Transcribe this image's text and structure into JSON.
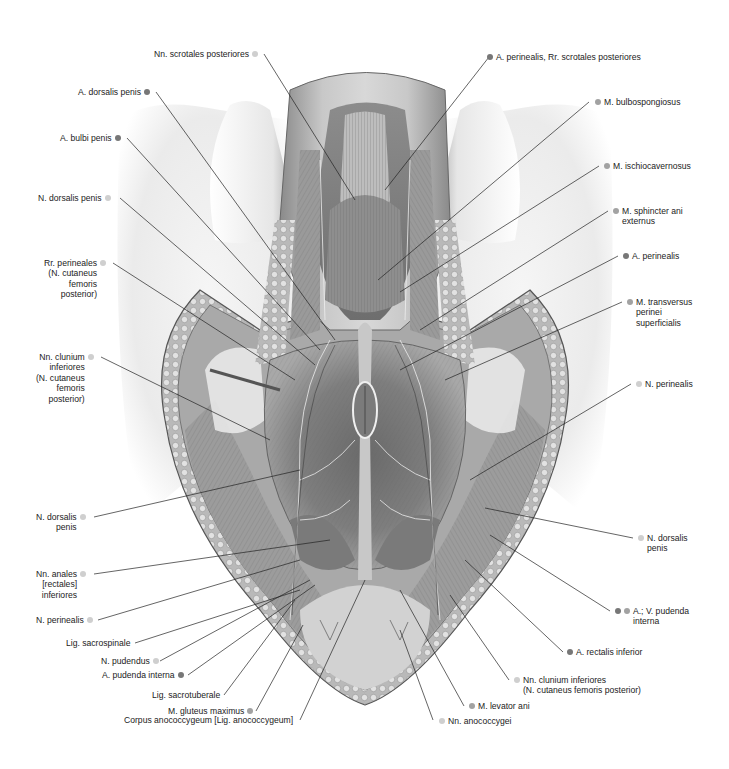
{
  "figure": {
    "legend_dot_colors": {
      "artery": "#777777",
      "muscle": "#a2a2a2",
      "nerve": "#cfcfcf"
    }
  },
  "labels_left": [
    {
      "id": "nn-scrotales-posteriores",
      "lines": [
        "Nn. scrotales posteriores"
      ],
      "dots": [
        "nerve"
      ]
    },
    {
      "id": "a-dorsalis-penis",
      "lines": [
        "A. dorsalis penis"
      ],
      "dots": [
        "artery"
      ]
    },
    {
      "id": "a-bulbi-penis",
      "lines": [
        "A. bulbi penis"
      ],
      "dots": [
        "artery"
      ]
    },
    {
      "id": "n-dorsalis-penis-upper",
      "lines": [
        "N. dorsalis penis"
      ],
      "dots": [
        "nerve"
      ]
    },
    {
      "id": "rr-perineales",
      "lines": [
        "Rr. perineales",
        "(N. cutaneus",
        "femoris",
        "posterior)"
      ],
      "dots": [
        "nerve"
      ]
    },
    {
      "id": "nn-clunium-inferiores-left",
      "lines": [
        "Nn. clunium",
        "inferiores",
        "(N. cutaneus",
        "femoris",
        "posterior)"
      ],
      "dots": [
        "nerve"
      ]
    },
    {
      "id": "n-dorsalis-penis-lower",
      "lines": [
        "N. dorsalis",
        "penis"
      ],
      "dots": [
        "nerve"
      ]
    },
    {
      "id": "nn-anales",
      "lines": [
        "Nn. anales",
        "[rectales]",
        "inferiores"
      ],
      "dots": [
        "nerve"
      ]
    },
    {
      "id": "n-perinealis-left",
      "lines": [
        "N. perinealis"
      ],
      "dots": [
        "nerve"
      ]
    },
    {
      "id": "lig-sacrospinale",
      "lines": [
        "Lig. sacrospinale"
      ],
      "dots": []
    },
    {
      "id": "n-pudendus",
      "lines": [
        "N. pudendus"
      ],
      "dots": [
        "nerve"
      ]
    },
    {
      "id": "a-pudenda-interna",
      "lines": [
        "A. pudenda interna"
      ],
      "dots": [
        "artery"
      ]
    },
    {
      "id": "lig-sacrotuberale",
      "lines": [
        "Lig. sacrotuberale"
      ],
      "dots": []
    },
    {
      "id": "m-gluteus-maximus",
      "lines": [
        "M. gluteus maximus"
      ],
      "dots": [
        "muscle"
      ]
    },
    {
      "id": "corpus-anococcygeum",
      "lines": [
        "Corpus anococcygeum [Lig. anococcygeum]"
      ],
      "dots": []
    }
  ],
  "labels_right": [
    {
      "id": "a-perinealis-rr-scrotales",
      "lines": [
        "A. perinealis, Rr. scrotales posteriores"
      ],
      "dots": [
        "artery"
      ]
    },
    {
      "id": "m-bulbospongiosus",
      "lines": [
        "M. bulbospongiosus"
      ],
      "dots": [
        "muscle"
      ]
    },
    {
      "id": "m-ischiocavernosus",
      "lines": [
        "M. ischiocavernosus"
      ],
      "dots": [
        "muscle"
      ]
    },
    {
      "id": "m-sphincter-ani-externus",
      "lines": [
        "M. sphincter ani",
        "externus"
      ],
      "dots": [
        "muscle"
      ]
    },
    {
      "id": "a-perinealis",
      "lines": [
        "A. perinealis"
      ],
      "dots": [
        "artery"
      ]
    },
    {
      "id": "m-transversus-perinei",
      "lines": [
        "M. transversus",
        "perinei",
        "superficialis"
      ],
      "dots": [
        "muscle"
      ]
    },
    {
      "id": "n-perinealis-right",
      "lines": [
        "N. perinealis"
      ],
      "dots": [
        "nerve"
      ]
    },
    {
      "id": "n-dorsalis-penis-right",
      "lines": [
        "N. dorsalis",
        "penis"
      ],
      "dots": [
        "nerve"
      ]
    },
    {
      "id": "a-v-pudenda-interna",
      "lines": [
        "A.; V. pudenda",
        "interna"
      ],
      "dots": [
        "artery",
        "muscle"
      ]
    },
    {
      "id": "a-rectalis-inferior",
      "lines": [
        "A. rectalis inferior"
      ],
      "dots": [
        "artery"
      ]
    },
    {
      "id": "nn-clunium-inferiores-right",
      "lines": [
        "Nn. clunium inferiores",
        "(N. cutaneus femoris posterior)"
      ],
      "dots": [
        "nerve"
      ]
    },
    {
      "id": "m-levator-ani",
      "lines": [
        "M. levator ani"
      ],
      "dots": [
        "muscle"
      ]
    },
    {
      "id": "nn-anococcygei",
      "lines": [
        "Nn. anococcygei"
      ],
      "dots": [
        "nerve"
      ]
    }
  ],
  "text": {
    "nn_scrotales": "Nn. scrotales posteriores",
    "a_dorsalis_penis": "A. dorsalis penis",
    "a_bulbi_penis": "A. bulbi penis",
    "n_dorsalis_penis_upper": "N. dorsalis penis",
    "rr_perineales_1": "Rr. perineales",
    "rr_perineales_2": "(N. cutaneus",
    "rr_perineales_3": "femoris",
    "rr_perineales_4": "posterior)",
    "nn_clunium_l_1": "Nn. clunium",
    "nn_clunium_l_2": "inferiores",
    "nn_clunium_l_3": "(N. cutaneus",
    "nn_clunium_l_4": "femoris",
    "nn_clunium_l_5": "posterior)",
    "n_dorsalis_lower_1": "N. dorsalis",
    "n_dorsalis_lower_2": "penis",
    "nn_anales_1": "Nn. anales",
    "nn_anales_2": "[rectales]",
    "nn_anales_3": "inferiores",
    "n_perinealis_left": "N. perinealis",
    "lig_sacrospinale": "Lig. sacrospinale",
    "n_pudendus": "N. pudendus",
    "a_pudenda_interna": "A. pudenda interna",
    "lig_sacrotuberale": "Lig. sacrotuberale",
    "m_gluteus_maximus": "M. gluteus maximus",
    "corpus_anococcygeum": "Corpus anococcygeum [Lig. anococcygeum]",
    "a_perinealis_rr": "A. perinealis, Rr. scrotales posteriores",
    "m_bulbospongiosus": "M. bulbospongiosus",
    "m_ischiocavernosus": "M. ischiocavernosus",
    "m_sphincter_1": "M. sphincter ani",
    "m_sphincter_2": "externus",
    "a_perinealis": "A. perinealis",
    "m_transversus_1": "M. transversus",
    "m_transversus_2": "perinei",
    "m_transversus_3": "superficialis",
    "n_perinealis_right": "N. perinealis",
    "n_dorsalis_right_1": "N. dorsalis",
    "n_dorsalis_right_2": "penis",
    "a_v_pudenda_1": "A.; V. pudenda",
    "a_v_pudenda_2": "interna",
    "a_rectalis_inferior": "A. rectalis inferior",
    "nn_clunium_r_1": "Nn. clunium inferiores",
    "nn_clunium_r_2": "(N. cutaneus femoris posterior)",
    "m_levator_ani": "M. levator ani",
    "nn_anococcygei": "Nn. anococcygei"
  }
}
